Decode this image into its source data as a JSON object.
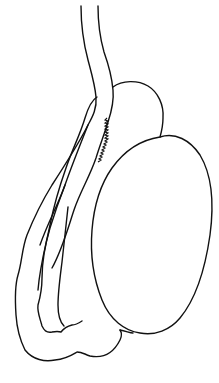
{
  "figure": {
    "parts": [
      {
        "id": "spermatic-cord",
        "label": ""
      },
      {
        "id": "epididymis-head",
        "label": ""
      },
      {
        "id": "testis",
        "label": ""
      },
      {
        "id": "epididymis-tail",
        "label": ""
      },
      {
        "id": "ductus-deferens",
        "label": ""
      }
    ],
    "colors": {
      "line": "#111111",
      "background": "#ffffff"
    }
  }
}
